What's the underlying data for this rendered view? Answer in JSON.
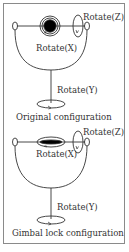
{
  "diagram": {
    "panels": [
      {
        "id": "original",
        "caption": "Original configuration",
        "labels": {
          "z": "Rotate(Z)",
          "x": "Rotate(X)",
          "y": "Rotate(Y)"
        },
        "inner_gimbal": "circle"
      },
      {
        "id": "gimbal-lock",
        "caption": "Gimbal lock configuration",
        "labels": {
          "z": "Rotate(Z)",
          "x": "Rotate(X)",
          "y": "Rotate(Y)"
        },
        "inner_gimbal": "flattened-ellipse"
      }
    ],
    "colors": {
      "stroke": "#333333",
      "frame": "#8a8a8a",
      "fill": "#000000"
    }
  }
}
